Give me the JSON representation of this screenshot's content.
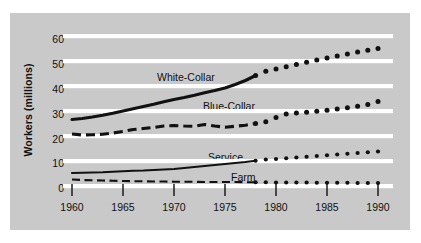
{
  "chart_data": {
    "type": "line",
    "title": "",
    "subtitle": "",
    "xlabel": "",
    "ylabel": "Workers (millions)",
    "xlim": [
      1960,
      1990
    ],
    "ylim": [
      0,
      60
    ],
    "xticks": [
      1960,
      1965,
      1970,
      1975,
      1980,
      1985,
      1990
    ],
    "yticks": [
      0,
      10,
      20,
      30,
      40,
      50,
      60
    ],
    "grid": "horizontal-white-bands",
    "legend": "inline-labels",
    "projection_start_year": 1978,
    "x": [
      1960,
      1961,
      1962,
      1963,
      1964,
      1965,
      1966,
      1967,
      1968,
      1969,
      1970,
      1971,
      1972,
      1973,
      1974,
      1975,
      1976,
      1977,
      1978,
      1979,
      1980,
      1981,
      1982,
      1983,
      1984,
      1985,
      1986,
      1987,
      1988,
      1989,
      1990
    ],
    "series": [
      {
        "name": "White-Collar",
        "style": "solid-thick",
        "projected_style": "dotted",
        "values": [
          27.0,
          27.4,
          28.0,
          28.7,
          29.5,
          30.4,
          31.3,
          32.2,
          33.1,
          34.1,
          35.0,
          35.8,
          36.7,
          37.7,
          38.6,
          39.6,
          41.0,
          42.6,
          44.6,
          46.3,
          47.2,
          48.1,
          49.0,
          49.9,
          50.8,
          51.6,
          52.4,
          53.2,
          54.0,
          54.7,
          55.4
        ]
      },
      {
        "name": "Blue-Collar",
        "style": "dashed-thick",
        "projected_style": "dotted",
        "values": [
          21.2,
          20.8,
          20.9,
          21.1,
          21.6,
          22.2,
          23.0,
          23.4,
          23.8,
          24.4,
          24.6,
          24.4,
          24.3,
          25.0,
          24.4,
          23.9,
          24.3,
          24.7,
          25.4,
          26.1,
          27.8,
          29.2,
          29.6,
          29.9,
          30.3,
          30.7,
          31.2,
          31.7,
          32.3,
          33.0,
          34.2
        ]
      },
      {
        "name": "Service",
        "style": "solid-thin",
        "projected_style": "dotted",
        "values": [
          5.6,
          5.7,
          5.8,
          5.9,
          6.1,
          6.3,
          6.5,
          6.6,
          6.8,
          7.0,
          7.2,
          7.6,
          8.0,
          8.4,
          8.8,
          9.2,
          9.6,
          10.0,
          10.5,
          11.0,
          11.2,
          11.5,
          11.8,
          12.1,
          12.4,
          12.7,
          13.0,
          13.3,
          13.6,
          13.9,
          14.2
        ]
      },
      {
        "name": "Farm",
        "style": "dashed-thin",
        "projected_style": "dotted",
        "values": [
          3.0,
          2.8,
          2.7,
          2.6,
          2.5,
          2.4,
          2.3,
          2.3,
          2.2,
          2.2,
          2.1,
          2.1,
          2.1,
          2.0,
          2.0,
          2.0,
          2.0,
          1.9,
          1.9,
          1.9,
          1.8,
          1.8,
          1.8,
          1.8,
          1.7,
          1.7,
          1.7,
          1.7,
          1.6,
          1.6,
          1.6
        ]
      }
    ]
  },
  "axis": {
    "y_title": "Workers (millions)",
    "y_ticks": [
      "60",
      "50",
      "40",
      "30",
      "20",
      "10",
      "0"
    ],
    "x_ticks": [
      "1960",
      "1965",
      "1970",
      "1975",
      "1980",
      "1985",
      "1990"
    ]
  },
  "series_labels": {
    "white_collar": "White-Collar",
    "blue_collar": "Blue-Collar",
    "service": "Service",
    "farm": "Farm"
  },
  "colors": {
    "panel_background": "#c9c9c9",
    "gridline": "#ffffff",
    "ink": "#111111",
    "page_background": "#ffffff"
  }
}
